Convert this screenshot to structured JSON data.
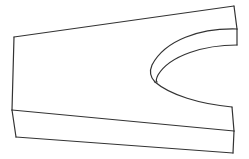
{
  "figure": {
    "width": 249,
    "height": 159,
    "stroke_color": "#333333",
    "background_color": "#ffffff",
    "stroke_width": 1.2
  },
  "edges": {
    "top_back": "M14 37 L234 6",
    "left_vertical": "M14 37 L12 110",
    "right_top_vertical": "M234 6 L237 29",
    "right_upper_vertical": "M237 29 L237 45",
    "slot_outer_top": "M237 29 C200 28 165 40 152 65 C149 72 151 78 155 82",
    "slot_inner_top": "M237 45 C205 45 170 55 158 75 C156 79 156 81 157 82",
    "slot_bottom": "M155 82 C170 95 200 104 232 107",
    "right_lower_vertical_top": "M232 107 L234 131",
    "front_top_edge": "M12 110 L234 131",
    "front_left_vertical": "M12 110 L16 137",
    "front_bottom_edge": "M16 137 L233 153",
    "front_right_vertical": "M234 131 L233 153"
  }
}
